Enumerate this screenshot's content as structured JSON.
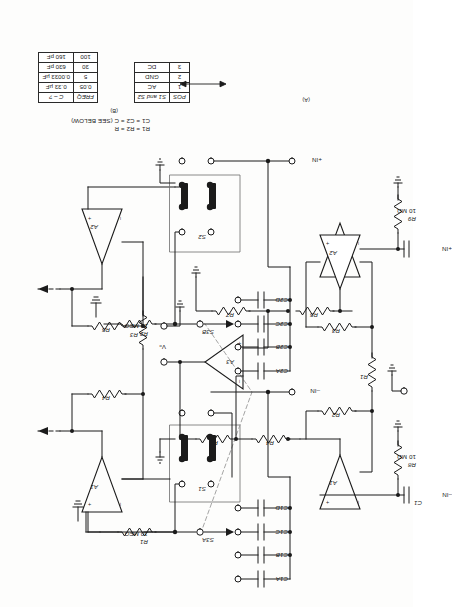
{
  "figure": {
    "label_a": "(A)",
    "label_b": "(B)",
    "notes": {
      "line1": "R1 = R2 = R",
      "line2": "C1 = C2 = C (SEE BELOW)"
    }
  },
  "circuit_b": {
    "amplifiers": [
      "A1",
      "A2"
    ],
    "resistors": [
      {
        "ref": "R1",
        "value": "10 MEG"
      },
      {
        "ref": "R2",
        "value": "10 MEG"
      },
      {
        "ref": "R3",
        "value": ""
      },
      {
        "ref": "R4",
        "value": ""
      },
      {
        "ref": "R5",
        "value": ""
      }
    ],
    "capacitors_bank1": [
      "C1A",
      "C1B",
      "C1C",
      "C1D"
    ],
    "capacitors_bank2": [
      "C2A",
      "C2B",
      "C2C",
      "C2D"
    ],
    "switches": [
      "S1",
      "S2",
      "S3A",
      "S3B"
    ],
    "terminals": {
      "neg_in": "–IN",
      "pos_in": "+IN"
    }
  },
  "circuit_a": {
    "amplifiers": [
      "A1",
      "A2",
      "A3"
    ],
    "resistors": [
      {
        "ref": "R1",
        "value": ""
      },
      {
        "ref": "R2",
        "value": ""
      },
      {
        "ref": "R3",
        "value": ""
      },
      {
        "ref": "R4",
        "value": ""
      },
      {
        "ref": "R5",
        "value": ""
      },
      {
        "ref": "R6",
        "value": ""
      },
      {
        "ref": "R7",
        "value": ""
      },
      {
        "ref": "R8",
        "value": "10 MΩ"
      },
      {
        "ref": "R9",
        "value": "10 MΩ"
      }
    ],
    "capacitors": [
      "C1",
      "C2"
    ],
    "terminals": {
      "neg_in": "–IN",
      "pos_in": "+IN",
      "output": "Vₒ"
    }
  },
  "table_switch": {
    "headers": [
      "POS",
      "S1 and S2"
    ],
    "rows": [
      {
        "pos": "1",
        "mode": "AC"
      },
      {
        "pos": "2",
        "mode": "GND"
      },
      {
        "pos": "3",
        "mode": "DC"
      }
    ]
  },
  "table_freq": {
    "headers": [
      "FREQ",
      "C – ?"
    ],
    "rows": [
      {
        "freq": "0.05",
        "c": "0.33 µF"
      },
      {
        "freq": "5",
        "c": "0.0033 µF"
      },
      {
        "freq": "30",
        "c": "630 pF"
      },
      {
        "freq": "100",
        "c": "160 pF"
      }
    ]
  },
  "colors": {
    "ink": "#1b1b1b",
    "paper": "#fdfdfc",
    "dashed": "#9a9a9a"
  }
}
